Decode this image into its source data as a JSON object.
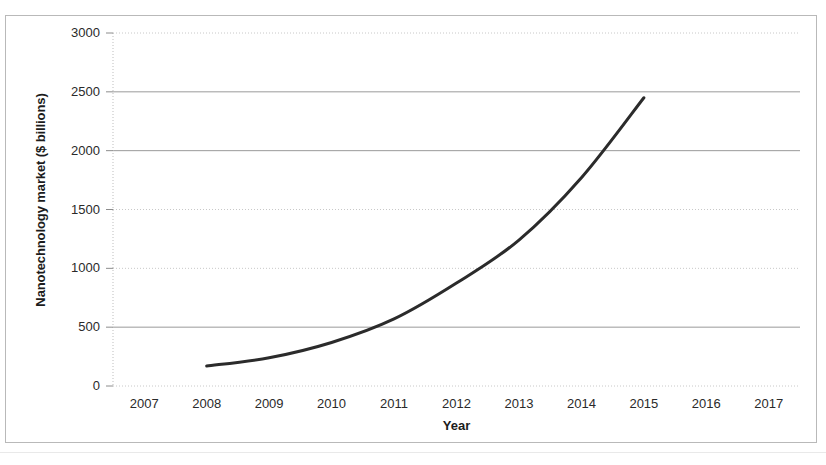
{
  "figure": {
    "background_color": "#ffffff",
    "frame_color": "#b9b9b9",
    "series_color": "#2b2b2b",
    "gridline_solid_color": "#9a9a9a",
    "gridline_dotted_color": "#c8c8c8"
  },
  "chart_data": {
    "type": "line",
    "title": "",
    "xlabel": "Year",
    "ylabel": "Nanotechnology market ($ billions)",
    "x": [
      2008,
      2009,
      2010,
      2011,
      2012,
      2013,
      2014,
      2015
    ],
    "values": [
      170,
      240,
      370,
      570,
      875,
      1240,
      1770,
      2450
    ],
    "series": [
      {
        "name": "Nanotechnology market",
        "values": [
          170,
          240,
          370,
          570,
          875,
          1240,
          1770,
          2450
        ]
      }
    ],
    "xlim": [
      2006.5,
      2017.5
    ],
    "ylim": [
      0,
      3000
    ],
    "xticks": [
      2007,
      2008,
      2009,
      2010,
      2011,
      2012,
      2013,
      2014,
      2015,
      2016,
      2017
    ],
    "xtick_labels": [
      "2007",
      "2008",
      "2009",
      "2010",
      "2011",
      "2012",
      "2013",
      "2014",
      "2015",
      "2016",
      "2017"
    ],
    "yticks": [
      0,
      500,
      1000,
      1500,
      2000,
      2500,
      3000
    ],
    "ytick_labels": [
      "0",
      "500",
      "1000",
      "1500",
      "2000",
      "2500",
      "3000"
    ],
    "grid": true,
    "grid_axis": "y",
    "legend": false,
    "legend_position": "none",
    "markers": false
  }
}
